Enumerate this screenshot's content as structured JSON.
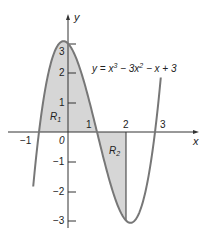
{
  "chart_data": {
    "type": "line",
    "title": "",
    "equation": "y = x^3 - 3x^2 - x + 3",
    "equation_display": {
      "lhs": "y = x",
      "p1": "3",
      "mid": " − 3x",
      "p2": "2",
      "rhs": " − x + 3"
    },
    "xlabel": "x",
    "ylabel": "y",
    "xlim": [
      -1.3,
      3.5
    ],
    "ylim": [
      -3.3,
      3.8
    ],
    "x_ticks": [
      "-1",
      "0",
      "1",
      "2",
      "3"
    ],
    "y_ticks": [
      "-3",
      "-2",
      "-1",
      "1",
      "2",
      "3"
    ],
    "grid": false,
    "series": [
      {
        "name": "y = x^3 - 3x^2 - x + 3",
        "x": [
          -1.2,
          -1,
          -0.5,
          0,
          0.5,
          1,
          1.5,
          2,
          2.5,
          3,
          3.2
        ],
        "y": [
          -1.57,
          0,
          1.88,
          3,
          1.88,
          0,
          -1.88,
          -3,
          -1.88,
          0,
          1.57
        ]
      }
    ],
    "regions": [
      {
        "label": "R1",
        "from": -1,
        "to": 1,
        "side": "above x-axis"
      },
      {
        "label": "R2",
        "from": 1,
        "to": 2,
        "side": "below x-axis"
      }
    ],
    "annotations": [
      {
        "text": "R1",
        "x": -0.5,
        "y": 0.4
      },
      {
        "text": "R2",
        "x": 1.6,
        "y": -0.6
      }
    ]
  },
  "labels": {
    "x_axis": "x",
    "y_axis": "y",
    "origin": "0",
    "xm1": "−1",
    "x1": "1",
    "x2": "2",
    "x3": "3",
    "y3": "3",
    "y2": "2",
    "y1": "1",
    "ym1": "−1",
    "ym2": "−2",
    "ym3": "−3",
    "r1_main": "R",
    "r1_sub": "1",
    "r2_main": "R",
    "r2_sub": "2"
  },
  "colors": {
    "curve": "#777777",
    "fill": "#d6d6d6",
    "axis": "#333333"
  }
}
